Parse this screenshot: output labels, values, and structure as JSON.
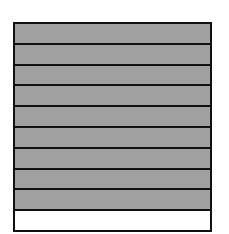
{
  "diagram": {
    "type": "fraction-bar",
    "orientation": "vertical-stack",
    "total_parts": 10,
    "shaded_parts": 9,
    "colors": {
      "shaded": "#a0a0a0",
      "unshaded": "#ffffff",
      "border": "#111111"
    },
    "segments": [
      {
        "index": 1,
        "shaded": true
      },
      {
        "index": 2,
        "shaded": true
      },
      {
        "index": 3,
        "shaded": true
      },
      {
        "index": 4,
        "shaded": true
      },
      {
        "index": 5,
        "shaded": true
      },
      {
        "index": 6,
        "shaded": true
      },
      {
        "index": 7,
        "shaded": true
      },
      {
        "index": 8,
        "shaded": true
      },
      {
        "index": 9,
        "shaded": true
      },
      {
        "index": 10,
        "shaded": false
      }
    ]
  }
}
